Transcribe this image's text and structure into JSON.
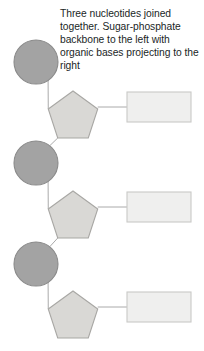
{
  "caption": {
    "text": "Three nucleotides joined together. Sugar-phosphate backbone to the left with organic bases projecting to the right"
  },
  "colors": {
    "phosphate_fill": "#a3a3a3",
    "phosphate_stroke": "#8a8a8a",
    "sugar_fill": "#d9d8d5",
    "sugar_stroke": "#a8a7a4",
    "base_fill": "#efefee",
    "base_stroke": "#c9c9c7",
    "connector_stroke": "#a0a0a0",
    "text": "#211f1f",
    "background": "#ffffff"
  },
  "diagram": {
    "type": "nucleotide-chain",
    "unit_count": 3,
    "units": [
      {
        "index": 1,
        "phosphate": {
          "cx": 36,
          "cy": 62,
          "r": 22
        },
        "sugar": {
          "cx": 73,
          "cy": 117,
          "r": 26
        },
        "base": {
          "x": 127,
          "y": 92,
          "w": 64,
          "h": 30
        }
      },
      {
        "index": 2,
        "phosphate": {
          "cx": 36,
          "cy": 163,
          "r": 22
        },
        "sugar": {
          "cx": 73,
          "cy": 217,
          "r": 26
        },
        "base": {
          "x": 127,
          "y": 192,
          "w": 64,
          "h": 30
        }
      },
      {
        "index": 3,
        "phosphate": {
          "cx": 36,
          "cy": 264,
          "r": 22
        },
        "sugar": {
          "cx": 73,
          "cy": 317,
          "r": 26
        },
        "base": {
          "x": 127,
          "y": 292,
          "w": 64,
          "h": 30
        }
      }
    ],
    "labels": {
      "phosphate": "phosphate group",
      "sugar": "sugar (pentose) ring",
      "base": "organic base",
      "backbone_link": "sugar-phosphate backbone link",
      "base_link": "sugar to base link"
    }
  }
}
